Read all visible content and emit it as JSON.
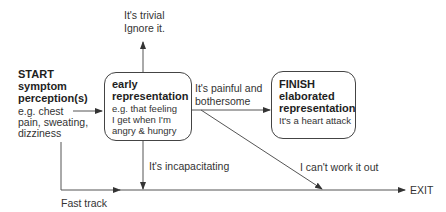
{
  "diagram": {
    "start": {
      "title": "START",
      "subtitle_line1": "symptom",
      "subtitle_line2": "perception(s)",
      "example_line1": "e.g. chest",
      "example_line2": "pain, sweating,",
      "example_line3": "dizziness"
    },
    "early_box": {
      "title_line1": "early",
      "title_line2": "representation",
      "example_line1": "e.g. that feeling",
      "example_line2": "I get when I'm",
      "example_line3": "angry & hungry"
    },
    "finish_box": {
      "title_line1": "FINISH",
      "title_line2": "elaborated",
      "title_line3": "representation",
      "example": "It's a heart attack"
    },
    "edges": {
      "trivial_line1": "It's trivial",
      "trivial_line2": "Ignore it.",
      "painful_line1": "It's painful and",
      "painful_line2": "bothersome",
      "incapacitating": "It's incapacitating",
      "cant_work_out": "I can't work it out",
      "fast_track": "Fast track",
      "exit": "EXIT"
    },
    "colors": {
      "line": "#444444",
      "text": "#333333"
    }
  }
}
